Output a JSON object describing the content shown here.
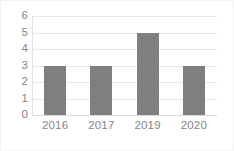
{
  "chart_data": {
    "type": "bar",
    "title": "",
    "subtitle": "",
    "xlabel": "",
    "ylabel": "",
    "categories": [
      "2016",
      "2017",
      "2019",
      "2020"
    ],
    "values": [
      3,
      3,
      5,
      3
    ],
    "series": [
      {
        "name": "",
        "values": [
          3,
          3,
          5,
          3
        ]
      }
    ],
    "ylim": [
      0,
      6
    ],
    "yticks": [
      0,
      1,
      2,
      3,
      4,
      5,
      6
    ],
    "ytick_labels": [
      "0",
      "1",
      "2",
      "3",
      "4",
      "5",
      "6"
    ],
    "grid": true,
    "grid_axis": "y",
    "legend": false,
    "legend_position": "none",
    "annotations": [],
    "colors": {
      "bar": "#7f7f7f",
      "gridline": "#e9e9e9",
      "axis_line": "#e2e2e2",
      "tick_label": "#868686",
      "background": "#ffffff",
      "border": "#f2f2f2"
    }
  }
}
